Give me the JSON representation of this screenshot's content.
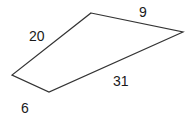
{
  "diagram": {
    "shape": "quadrilateral",
    "vertices": [
      [
        91,
        13
      ],
      [
        183,
        32
      ],
      [
        49,
        92
      ],
      [
        12,
        75
      ]
    ],
    "stroke_color": "#333333",
    "labels": [
      {
        "side": "top-left",
        "text": "20"
      },
      {
        "side": "top-right",
        "text": "9"
      },
      {
        "side": "bottom-right",
        "text": "31"
      },
      {
        "side": "bottom-left",
        "text": "6"
      }
    ]
  }
}
